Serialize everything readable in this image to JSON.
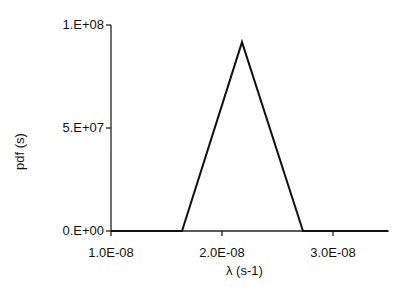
{
  "chart_data": {
    "type": "line",
    "title": "",
    "xlabel": "λ (s-1)",
    "ylabel": "pdf (s)",
    "x": [
      1e-08,
      1.64e-08,
      2.18e-08,
      2.73e-08,
      3.5e-08
    ],
    "series": [
      {
        "name": "pdf",
        "values": [
          0,
          0,
          91700000.0,
          0,
          0
        ]
      }
    ],
    "xlim": [
      1e-08,
      3.5e-08
    ],
    "ylim": [
      0,
      100000000.0
    ],
    "xticks": [
      "1.0E-08",
      "2.0E-08",
      "3.0E-08"
    ],
    "yticks": [
      "0.E+00",
      "5.E+07",
      "1.E+08"
    ],
    "grid": false,
    "legend": "none"
  },
  "axes": {
    "xlabel": "λ (s-1)",
    "ylabel": "pdf (s)",
    "xticks": [
      "1.0E-08",
      "2.0E-08",
      "3.0E-08"
    ],
    "yticks": [
      "1.E+08",
      "5.E+07",
      "0.E+00"
    ]
  }
}
